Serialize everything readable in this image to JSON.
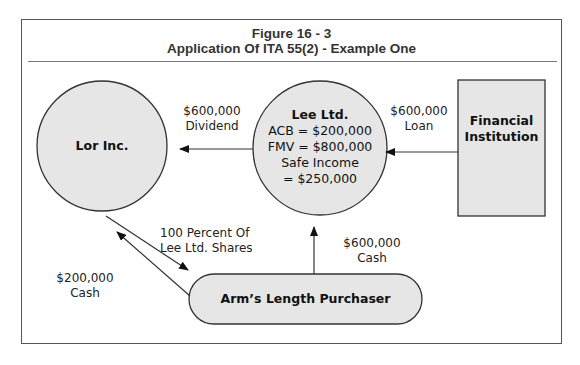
{
  "figure": {
    "title_line1": "Figure 16 - 3",
    "title_line2": "Application Of ITA 55(2) - Example One"
  },
  "nodes": {
    "lor": {
      "label": "Lor Inc.",
      "shape": "circle"
    },
    "lee": {
      "label": "Lee Ltd.",
      "acb": "ACB = $200,000",
      "fmv": "FMV = $800,000",
      "safe_income_1": "Safe Income",
      "safe_income_2": "= $250,000",
      "shape": "circle"
    },
    "bank": {
      "label_line1": "Financial",
      "label_line2": "Institution",
      "shape": "rectangle"
    },
    "purchaser": {
      "label": "Arm’s Length Purchaser",
      "shape": "pill"
    }
  },
  "edges": {
    "dividend": {
      "amount": "$600,000",
      "type": "Dividend",
      "from": "Lee Ltd.",
      "to": "Lor Inc."
    },
    "loan": {
      "amount": "$600,000",
      "type": "Loan",
      "from": "Financial Institution",
      "to": "Lee Ltd."
    },
    "shares": {
      "line1": "100 Percent Of",
      "line2": "Lee Ltd. Shares",
      "from": "Lor Inc.",
      "to": "Arm’s Length Purchaser"
    },
    "cash_lor": {
      "amount": "$200,000",
      "type": "Cash",
      "from": "Arm’s Length Purchaser",
      "to": "Lor Inc."
    },
    "cash_lee": {
      "amount": "$600,000",
      "type": "Cash",
      "from": "Arm’s Length Purchaser",
      "to": "Lee Ltd."
    }
  },
  "colors": {
    "node_fill": "#e6e6e6",
    "stroke": "#333333",
    "frame": "#555555"
  }
}
